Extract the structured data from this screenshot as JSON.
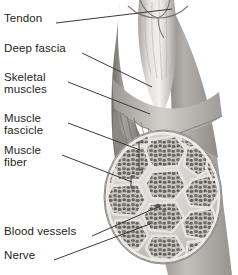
{
  "figure": {
    "background": "#ffffff",
    "text_color": "#231f20",
    "leader_color": "#3a3a3a"
  },
  "labels": [
    {
      "id": "tendon",
      "text": "Tendon",
      "x": 4,
      "y": 19
    },
    {
      "id": "deep-fascia",
      "text": "Deep fascia",
      "x": 4,
      "y": 49
    },
    {
      "id": "skeletal",
      "text": "Skeletal\nmuscles",
      "x": 4,
      "y": 78
    },
    {
      "id": "fascicle",
      "text": "Muscle\nfascicle",
      "x": 4,
      "y": 119
    },
    {
      "id": "fiber",
      "text": "Muscle\nfiber",
      "x": 4,
      "y": 151
    },
    {
      "id": "blood-vessels",
      "text": "Blood vessels",
      "x": 4,
      "y": 232
    },
    {
      "id": "nerve",
      "text": "Nerve",
      "x": 4,
      "y": 256
    }
  ],
  "leaders": [
    {
      "id": "tendon-leader",
      "x1": 56,
      "y1": 23,
      "x2": 172,
      "y2": 9
    },
    {
      "id": "deep-fascia-leader",
      "x1": 82,
      "y1": 53,
      "x2": 152,
      "y2": 87
    },
    {
      "id": "skeletal-leader",
      "x1": 68,
      "y1": 82,
      "x2": 150,
      "y2": 114
    },
    {
      "id": "fascicle-leader",
      "x1": 68,
      "y1": 123,
      "x2": 140,
      "y2": 150
    },
    {
      "id": "fiber-leader",
      "x1": 62,
      "y1": 155,
      "x2": 132,
      "y2": 182
    },
    {
      "id": "blood-vessels-leader",
      "x1": 92,
      "y1": 236,
      "x2": 160,
      "y2": 206
    },
    {
      "id": "nerve-leader",
      "x1": 54,
      "y1": 260,
      "x2": 150,
      "y2": 224
    }
  ],
  "anatomy": {
    "cross_section": {
      "name": "muscle-cross-section",
      "center_x": 163,
      "center_y": 197,
      "radius_x": 58,
      "radius_y": 66,
      "epimysium_color": "#cfcbc6",
      "perimysium_color": "#d8d5d0",
      "fascicle_color": "#b4b0ab",
      "fiber_color": "#6d6862"
    },
    "limb": {
      "name": "limb-silhouette",
      "tendon_color": "#d9d7d4",
      "muscle_color": "#8d8a86",
      "fascia_color": "#b8b5b1"
    }
  }
}
